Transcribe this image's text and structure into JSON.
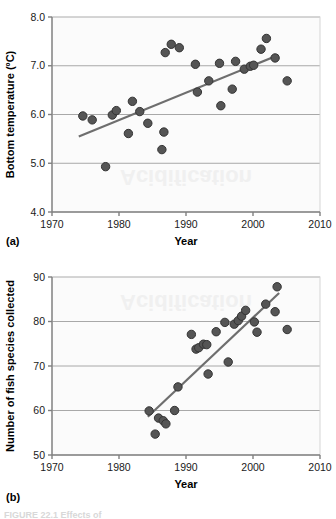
{
  "figure": {
    "caption_partial": "FIGURE 22.1 Effects of",
    "panel_a_label": "(a)",
    "panel_b_label": "(b)",
    "marker_color": "#555555",
    "marker_edge_color": "#333333",
    "trendline_color": "#6e6e6e",
    "gridline_color": "#a8a8a8",
    "axis_color": "#808080",
    "plot_background": "#fbfbfb",
    "watermark_text": "Acidification"
  },
  "chart_data": [
    {
      "type": "scatter",
      "id": "panel-a",
      "title": "",
      "xlabel": "Year",
      "ylabel": "Bottom temperature (ºC)",
      "xlim": [
        1970,
        2010
      ],
      "ylim": [
        4.0,
        8.0
      ],
      "xticks": [
        1970,
        1980,
        1990,
        2000,
        2010
      ],
      "xtick_labels": [
        "1970",
        "1980",
        "1990",
        "2000",
        "2010"
      ],
      "yticks": [
        4.0,
        5.0,
        6.0,
        7.0,
        8.0
      ],
      "ytick_labels": [
        "4.0",
        "5.0",
        "6.0",
        "7.0",
        "8.0"
      ],
      "grid": true,
      "grid_axis": "y",
      "legend": false,
      "points": [
        {
          "x": 1974.6,
          "y": 5.97
        },
        {
          "x": 1976.0,
          "y": 5.89
        },
        {
          "x": 1978.0,
          "y": 4.93
        },
        {
          "x": 1979.0,
          "y": 5.99
        },
        {
          "x": 1979.6,
          "y": 6.08
        },
        {
          "x": 1981.4,
          "y": 5.61
        },
        {
          "x": 1982.0,
          "y": 6.27
        },
        {
          "x": 1983.1,
          "y": 6.06
        },
        {
          "x": 1984.3,
          "y": 5.82
        },
        {
          "x": 1986.4,
          "y": 5.28
        },
        {
          "x": 1986.7,
          "y": 5.64
        },
        {
          "x": 1986.9,
          "y": 7.27
        },
        {
          "x": 1987.8,
          "y": 7.44
        },
        {
          "x": 1989.0,
          "y": 7.37
        },
        {
          "x": 1991.4,
          "y": 7.03
        },
        {
          "x": 1991.7,
          "y": 6.46
        },
        {
          "x": 1993.4,
          "y": 6.69
        },
        {
          "x": 1995.0,
          "y": 7.05
        },
        {
          "x": 1995.2,
          "y": 6.18
        },
        {
          "x": 1996.9,
          "y": 6.52
        },
        {
          "x": 1997.4,
          "y": 7.09
        },
        {
          "x": 1998.7,
          "y": 6.93
        },
        {
          "x": 1999.6,
          "y": 6.99
        },
        {
          "x": 2000.1,
          "y": 7.01
        },
        {
          "x": 2001.2,
          "y": 7.34
        },
        {
          "x": 2002.0,
          "y": 7.56
        },
        {
          "x": 2003.3,
          "y": 7.16
        },
        {
          "x": 2005.1,
          "y": 6.69
        }
      ],
      "trendline": {
        "x1": 1974.0,
        "y1": 5.55,
        "x2": 2003.8,
        "y2": 7.22
      }
    },
    {
      "type": "scatter",
      "id": "panel-b",
      "title": "",
      "xlabel": "Year",
      "ylabel": "Number of fish species collected",
      "xlim": [
        1970,
        2010
      ],
      "ylim": [
        50,
        90
      ],
      "xticks": [
        1970,
        1980,
        1990,
        2000,
        2010
      ],
      "xtick_labels": [
        "1970",
        "1980",
        "1990",
        "2000",
        "2010"
      ],
      "yticks": [
        50,
        60,
        70,
        80,
        90
      ],
      "ytick_labels": [
        "50",
        "60",
        "70",
        "80",
        "90"
      ],
      "grid": true,
      "grid_axis": "y",
      "legend": false,
      "points": [
        {
          "x": 1984.5,
          "y": 59.9
        },
        {
          "x": 1985.4,
          "y": 54.7
        },
        {
          "x": 1985.9,
          "y": 58.3
        },
        {
          "x": 1986.6,
          "y": 57.7
        },
        {
          "x": 1987.0,
          "y": 57.0
        },
        {
          "x": 1988.3,
          "y": 60.0
        },
        {
          "x": 1988.8,
          "y": 65.3
        },
        {
          "x": 1990.8,
          "y": 77.1
        },
        {
          "x": 1991.5,
          "y": 73.8
        },
        {
          "x": 1991.9,
          "y": 74.1
        },
        {
          "x": 1992.6,
          "y": 74.9
        },
        {
          "x": 1993.1,
          "y": 74.8
        },
        {
          "x": 1993.3,
          "y": 68.2
        },
        {
          "x": 1994.5,
          "y": 77.7
        },
        {
          "x": 1995.8,
          "y": 79.8
        },
        {
          "x": 1996.3,
          "y": 70.9
        },
        {
          "x": 1997.2,
          "y": 79.4
        },
        {
          "x": 1997.8,
          "y": 80.2
        },
        {
          "x": 1998.3,
          "y": 81.2
        },
        {
          "x": 1998.9,
          "y": 82.5
        },
        {
          "x": 2000.2,
          "y": 79.9
        },
        {
          "x": 2000.6,
          "y": 77.6
        },
        {
          "x": 2001.9,
          "y": 83.9
        },
        {
          "x": 2003.3,
          "y": 82.2
        },
        {
          "x": 2003.6,
          "y": 87.8
        },
        {
          "x": 2005.1,
          "y": 78.2
        }
      ],
      "trendline": {
        "x1": 1984.3,
        "y1": 58.6,
        "x2": 2003.9,
        "y2": 86.4
      }
    }
  ]
}
